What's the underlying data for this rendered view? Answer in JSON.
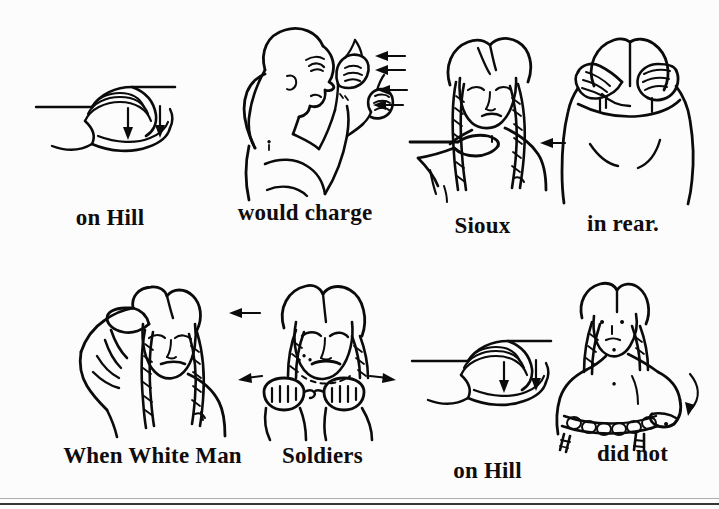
{
  "page": {
    "background_color": "#fcfcfc",
    "ink_color": "#0b0b0b",
    "width": 719,
    "height": 509,
    "sentence": "on Hill would charge Sioux in rear. When White Man Soldiers on Hill did not"
  },
  "rows": [
    {
      "row_label": "top-row",
      "panels": [
        {
          "caption": "on Hill",
          "icon": "hand-flat-with-down-arrows-icon",
          "arrows": [
            "down",
            "down"
          ],
          "arrow_count": 2
        },
        {
          "caption": "would charge",
          "icon": "figure-profile-two-raised-hands-icon",
          "arrows": [
            "left",
            "left",
            "left",
            "left"
          ],
          "arrow_count": 4
        },
        {
          "caption": "Sioux",
          "icon": "figure-hand-across-throat-icon",
          "arrows": [
            "left"
          ],
          "arrow_count": 1
        },
        {
          "caption": "in rear.",
          "icon": "figure-from-behind-hands-on-head-icon",
          "arrows": [],
          "arrow_count": 0
        }
      ]
    },
    {
      "row_label": "bottom-row",
      "panels": [
        {
          "caption": "When White Man",
          "icon": "figure-hand-across-forehead-icon",
          "arrows": [
            "left"
          ],
          "arrow_count": 1
        },
        {
          "caption": "Soldiers",
          "icon": "figure-two-fists-apart-icon",
          "arrows": [
            "left",
            "right"
          ],
          "arrow_count": 2
        },
        {
          "caption": "on Hill",
          "icon": "hand-flat-with-down-arrows-icon",
          "arrows": [
            "down",
            "down"
          ],
          "arrow_count": 2
        },
        {
          "caption": "did not",
          "icon": "figure-hand-sweeping-down-icon",
          "arrows": [
            "down"
          ],
          "arrow_count": 1
        }
      ]
    }
  ]
}
